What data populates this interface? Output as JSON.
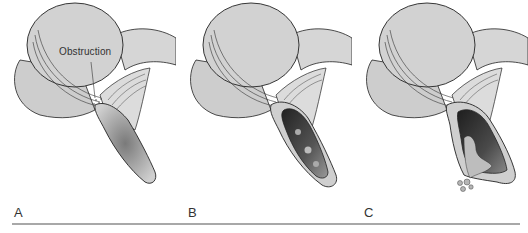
{
  "figure": {
    "panels": [
      {
        "id": "A",
        "label": "A",
        "stage": "obstruction",
        "callout": "Obstruction"
      },
      {
        "id": "B",
        "label": "B",
        "stage": "distended-inflamed"
      },
      {
        "id": "C",
        "label": "C",
        "stage": "perforated"
      }
    ]
  },
  "colors": {
    "tissue": "#cfcfcf",
    "tissue_dark": "#b8b8b8",
    "outline": "#222222",
    "lumen_dark": "#3a3a3a",
    "rule": "#a8a8a8"
  }
}
